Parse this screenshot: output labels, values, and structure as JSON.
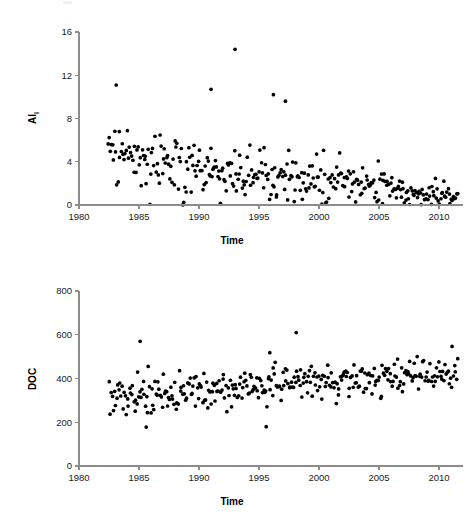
{
  "figure": {
    "type": "scatter-panel-figure",
    "panel_count": 2,
    "background_color": "#ffffff",
    "point_color": "#000000",
    "axis_color": "#8c8c8c"
  },
  "panels": [
    {
      "id": "top",
      "ylabel_main": "Al",
      "ylabel_sub": "i",
      "xlabel": "Time"
    },
    {
      "id": "bottom",
      "ylabel_main": "DOC",
      "ylabel_sub": "",
      "xlabel": "Time"
    }
  ],
  "chart_data": [
    {
      "type": "scatter",
      "title": "",
      "xlabel": "Time",
      "ylabel": "Al_i",
      "ylabel_display": "Ali",
      "xlim": [
        1980,
        2012
      ],
      "ylim": [
        0,
        16
      ],
      "xticks": [
        1980,
        1985,
        1990,
        1995,
        2000,
        2005,
        2010
      ],
      "yticks": [
        0,
        4,
        8,
        12,
        16
      ],
      "xticklabels": [
        "1980",
        "1985",
        "1990",
        "1995",
        "2000",
        "2005",
        "2010"
      ],
      "yticklabels": [
        "0",
        "4",
        "8",
        "12",
        "16"
      ],
      "grid": false,
      "legend": false,
      "marker": "circle",
      "marker_color": "#000000",
      "marker_size": 2.6,
      "n_points": 330,
      "data_start_year": 1982.4,
      "data_end_year": 2011.6,
      "trend": "decreasing",
      "trend_description": "Labile aluminium declines from a mean near 4.2 in the early 1980s to near 0.6 by 2011",
      "annotations": [
        {
          "label": "maximum",
          "x": 1993.0,
          "y": 14.4
        },
        {
          "label": "early-high",
          "x": 1983.1,
          "y": 11.1
        },
        {
          "label": "1991-high",
          "x": 1991.0,
          "y": 10.7
        },
        {
          "label": "1996-high",
          "x": 1996.2,
          "y": 10.2
        },
        {
          "label": "1997-high",
          "x": 1997.2,
          "y": 9.6
        }
      ],
      "series": [
        {
          "name": "Ali",
          "seed": 20110407,
          "envelope": {
            "mean_start": 4.3,
            "mean_end": 0.55,
            "spread_start": 2.6,
            "spread_end": 0.75,
            "floor": 0.0,
            "ceiling": 14.6
          }
        }
      ]
    },
    {
      "type": "scatter",
      "title": "",
      "xlabel": "Time",
      "ylabel": "DOC",
      "ylabel_display": "DOC",
      "xlim": [
        1980,
        2012
      ],
      "ylim": [
        0,
        800
      ],
      "xticks": [
        1980,
        1985,
        1990,
        1995,
        2000,
        2005,
        2010
      ],
      "yticks": [
        0,
        200,
        400,
        600,
        800
      ],
      "xticklabels": [
        "1980",
        "1985",
        "1990",
        "1995",
        "2000",
        "2005",
        "2010"
      ],
      "yticklabels": [
        "0",
        "200",
        "400",
        "600",
        "800"
      ],
      "grid": false,
      "legend": false,
      "marker": "circle",
      "marker_color": "#000000",
      "marker_size": 2.6,
      "n_points": 330,
      "data_start_year": 1982.5,
      "data_end_year": 2011.6,
      "trend": "increasing",
      "trend_description": "Dissolved organic carbon rises from a mean near 305 in the early 1980s to near 420 by 2011",
      "annotations": [
        {
          "label": "maximum",
          "x": 1998.1,
          "y": 610
        },
        {
          "label": "1985-high",
          "x": 1985.1,
          "y": 570
        },
        {
          "label": "1996-high",
          "x": 1995.9,
          "y": 518
        },
        {
          "label": "minimum",
          "x": 1985.6,
          "y": 178
        },
        {
          "label": "1995-low",
          "x": 1995.6,
          "y": 180
        }
      ],
      "series": [
        {
          "name": "DOC",
          "seed": 73510221,
          "envelope": {
            "mean_start": 305,
            "mean_end": 425,
            "spread_start": 62,
            "spread_end": 55,
            "floor": 175,
            "ceiling": 615
          }
        }
      ]
    }
  ]
}
